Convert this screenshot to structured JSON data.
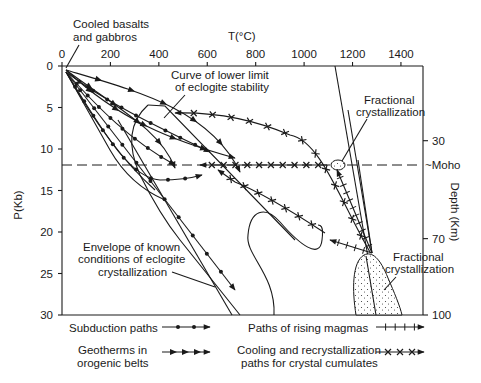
{
  "figure": {
    "x_axis": {
      "label": "T(°C)",
      "ticks": [
        "0",
        "200",
        "400",
        "600",
        "800",
        "1000",
        "1200",
        "1400"
      ],
      "range": [
        0,
        1480
      ]
    },
    "y_axis_left": {
      "label": "P(Kb)",
      "ticks": [
        "0",
        "5",
        "10",
        "15",
        "20",
        "25",
        "30"
      ],
      "range": [
        0,
        30
      ]
    },
    "y_axis_right": {
      "label": "Depth (Km)",
      "ticks": [
        {
          "label": "30",
          "p": 9.0
        },
        {
          "label": "70",
          "p": 20.8
        },
        {
          "label": "100",
          "p": 30
        }
      ]
    },
    "moho": {
      "label": "~Moho",
      "p": 11.9
    },
    "annotations": {
      "cooled_basalts": [
        "Cooled basalts",
        "and gabbros"
      ],
      "eclogite_curve": [
        "Curve of lower limit",
        "of eclogite stability"
      ],
      "fractional_upper": [
        "Fractional",
        "crystallization"
      ],
      "fractional_lower": [
        "Fractional",
        "crystallization"
      ],
      "envelope": [
        "Envelope of known",
        "conditions  of eclogite",
        "crystallization"
      ]
    },
    "legend": {
      "subduction": "Subduction paths",
      "geotherms": [
        "Geotherms in",
        "orogenic belts"
      ],
      "rising_magmas": "Paths of rising magmas",
      "cooling": [
        "Cooling and recrystallization",
        "paths for crystal cumulates"
      ]
    }
  }
}
